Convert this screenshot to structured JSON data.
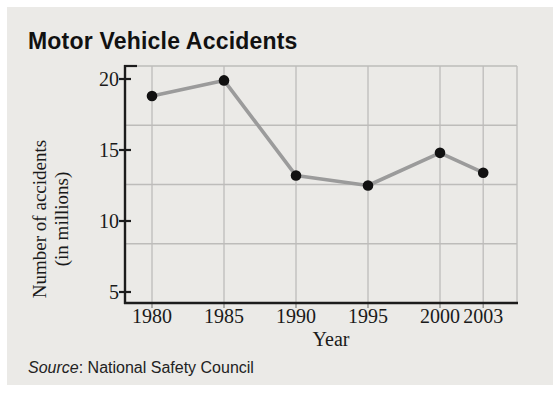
{
  "chart": {
    "title": "Motor Vehicle Accidents",
    "ylabel_line1": "Number of accidents",
    "ylabel_line2": "(in millions)",
    "xlabel": "Year",
    "source_prefix": "Source",
    "source_rest": ": National Safety Council"
  },
  "chart_data": {
    "type": "line",
    "title": "Motor Vehicle Accidents",
    "xlabel": "Year",
    "ylabel": "Number of accidents (in millions)",
    "categories": [
      "1980",
      "1985",
      "1990",
      "1995",
      "2000",
      "2003"
    ],
    "x_years": [
      1980,
      1985,
      1990,
      1995,
      2000,
      2003
    ],
    "values": [
      18.8,
      19.9,
      13.2,
      12.5,
      14.8,
      13.4
    ],
    "y_ticks": [
      20,
      15,
      10,
      5
    ],
    "ylim": [
      4,
      21
    ],
    "grid": true,
    "legend": false,
    "source": "Source: National Safety Council"
  },
  "colors": {
    "panel_bg": "#ebeae7",
    "grid": "#bdbcba",
    "axis": "#1c1c1c",
    "text": "#1a1a1a",
    "line": "#9b9b9b",
    "point": "#111111"
  }
}
